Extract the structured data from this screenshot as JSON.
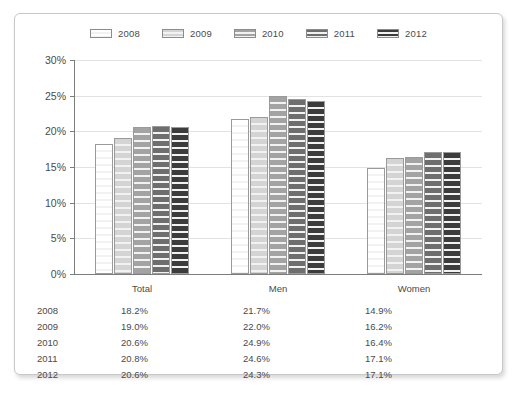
{
  "chart_data": {
    "type": "bar",
    "title": "",
    "subtitle": "",
    "xlabel": "",
    "ylabel": "",
    "grid": true,
    "legend_position": "top-center",
    "categories": [
      "Total",
      "Men",
      "Women"
    ],
    "ylim": [
      0,
      30
    ],
    "ytick_labels": [
      "0%",
      "5%",
      "10%",
      "15%",
      "20%",
      "25%",
      "30%"
    ],
    "ytick_values": [
      0,
      5,
      10,
      15,
      20,
      25,
      30
    ],
    "series": [
      {
        "name": "2008",
        "color": "#ffffff",
        "values": [
          18.2,
          21.7,
          14.9
        ]
      },
      {
        "name": "2009",
        "color": "#d4d4d4",
        "values": [
          19.0,
          22.0,
          16.2
        ]
      },
      {
        "name": "2010",
        "color": "#a3a3a3",
        "values": [
          20.6,
          24.9,
          16.4
        ]
      },
      {
        "name": "2011",
        "color": "#6e6e6e",
        "values": [
          20.8,
          24.6,
          17.1
        ]
      },
      {
        "name": "2012",
        "color": "#3c3c3c",
        "values": [
          20.6,
          24.3,
          17.1
        ]
      }
    ]
  },
  "legend": {
    "items": [
      {
        "label": "2008"
      },
      {
        "label": "2009"
      },
      {
        "label": "2010"
      },
      {
        "label": "2011"
      },
      {
        "label": "2012"
      }
    ]
  },
  "table": {
    "rows": [
      {
        "year": "2008",
        "total": "18.2%",
        "men": "21.7%",
        "women": "14.9%"
      },
      {
        "year": "2009",
        "total": "19.0%",
        "men": "22.0%",
        "women": "16.2%"
      },
      {
        "year": "2010",
        "total": "20.6%",
        "men": "24.9%",
        "women": "16.4%"
      },
      {
        "year": "2011",
        "total": "20.8%",
        "men": "24.6%",
        "women": "17.1%"
      },
      {
        "year": "2012",
        "total": "20.6%",
        "men": "24.3%",
        "women": "17.1%"
      }
    ]
  },
  "colors": {
    "panel_border": "#c8c8c8",
    "gridline": "#e2e2e2",
    "axis": "#7d7d7d",
    "text": "#4a4a4a"
  }
}
